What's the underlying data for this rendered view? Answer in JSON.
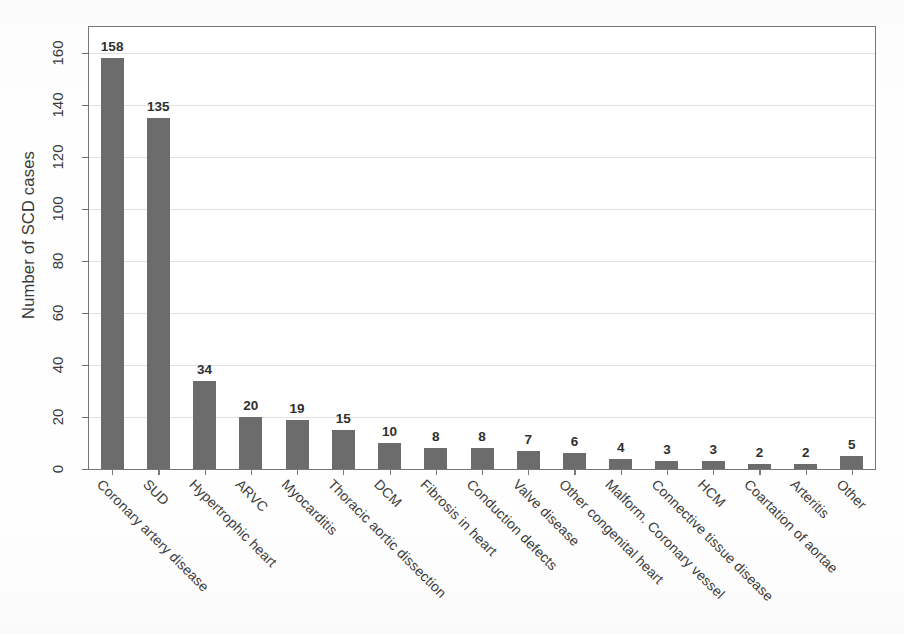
{
  "chart_data": {
    "type": "bar",
    "title": "",
    "xlabel": "",
    "ylabel": "Number of SCD cases",
    "ylim": [
      0,
      170
    ],
    "yticks": [
      0,
      20,
      40,
      60,
      80,
      100,
      120,
      140,
      160
    ],
    "ytick_labels": [
      "0",
      "20",
      "40",
      "60",
      "80",
      "100",
      "120",
      "140",
      "160"
    ],
    "grid": true,
    "legend": false,
    "bar_color": "#6c6c6c",
    "categories": [
      "Coronary artery disease",
      "SUD",
      "Hypertrophic heart",
      "ARVC",
      "Myocarditis",
      "Thoracic aortic dissection",
      "DCM",
      "Fibrosis in heart",
      "Conduction defects",
      "Valve disease",
      "Other congenital heart",
      "Malform. Coronary vessel",
      "Connective tissue disease",
      "HCM",
      "Coartation of aortae",
      "Arteritis",
      "Other"
    ],
    "values": [
      158,
      135,
      34,
      20,
      19,
      15,
      10,
      8,
      8,
      7,
      6,
      4,
      3,
      3,
      2,
      2,
      5
    ],
    "value_labels": [
      "158",
      "135",
      "34",
      "20",
      "19",
      "15",
      "10",
      "8",
      "8",
      "7",
      "6",
      "4",
      "3",
      "3",
      "2",
      "2",
      "5"
    ]
  }
}
